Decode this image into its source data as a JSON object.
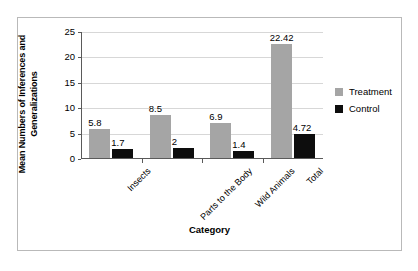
{
  "chart_data": {
    "type": "bar",
    "title": "",
    "xlabel": "Category",
    "ylabel": "Mean Numbers of Inferences and Generalizations",
    "categories": [
      "Insects",
      "Parts to the Body",
      "Wild Animals",
      "Total"
    ],
    "series": [
      {
        "name": "Treatment",
        "color": "#a5a5a5",
        "values": [
          5.8,
          8.5,
          6.9,
          22.42
        ],
        "labels": [
          "5.8",
          "8.5",
          "6.9",
          "22.42"
        ]
      },
      {
        "name": "Control",
        "color": "#0d0d0d",
        "values": [
          1.7,
          2,
          1.4,
          4.72
        ],
        "labels": [
          "1.7",
          "2",
          "1.4",
          "4.72"
        ]
      }
    ],
    "ylim": [
      0,
      25
    ],
    "yticks": [
      0,
      5,
      10,
      15,
      20,
      25
    ],
    "ytick_labels": [
      "0",
      "5",
      "10",
      "15",
      "20",
      "25"
    ],
    "grid": true,
    "legend_position": "right"
  },
  "axes": {
    "y_title": "Mean Numbers of Inferences and Generalizations",
    "x_title": "Category"
  },
  "legend": {
    "entries": [
      {
        "label": "Treatment",
        "swatch": "treatment-swatch-icon"
      },
      {
        "label": "Control",
        "swatch": "control-swatch-icon"
      }
    ]
  }
}
